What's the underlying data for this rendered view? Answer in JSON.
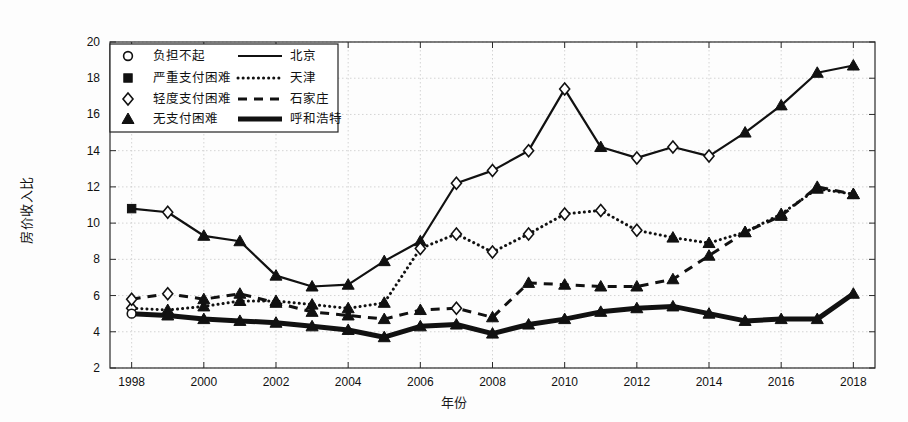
{
  "figure": {
    "background": "#fdfdfd",
    "frame_color": "#2a2a2a",
    "grid_color": "#c9c9c9"
  },
  "axes": {
    "ylabel": "房价收入比",
    "xlabel": "年份",
    "y_ticks": [
      "2",
      "4",
      "6",
      "8",
      "10",
      "12",
      "14",
      "16",
      "18",
      "20"
    ],
    "x_ticks": [
      "1998",
      "2000",
      "2002",
      "2004",
      "2006",
      "2008",
      "2010",
      "2012",
      "2014",
      "2016",
      "2018"
    ]
  },
  "legend": {
    "marker_entries": [
      {
        "marker": "circle-open-marker",
        "label": "负担不起"
      },
      {
        "marker": "square-filled-marker",
        "label": "严重支付困难"
      },
      {
        "marker": "diamond-open-marker",
        "label": "轻度支付困难"
      },
      {
        "marker": "triangle-filled-marker",
        "label": "无支付困难"
      }
    ],
    "line_entries": [
      {
        "style": "solid-thin-line",
        "label": "北京"
      },
      {
        "style": "dotted-line",
        "label": "天津"
      },
      {
        "style": "dashed-line",
        "label": "石家庄"
      },
      {
        "style": "solid-thick-line",
        "label": "呼和浩特"
      }
    ]
  },
  "chart_data": {
    "type": "line",
    "title": "",
    "xlabel": "年份",
    "ylabel": "房价收入比",
    "xlim": [
      1997.4,
      2018.6
    ],
    "ylim": [
      2,
      20
    ],
    "grid": true,
    "legend_position": "upper-left",
    "x": [
      1998,
      1999,
      2000,
      2001,
      2002,
      2003,
      2004,
      2005,
      2006,
      2007,
      2008,
      2009,
      2010,
      2011,
      2012,
      2013,
      2014,
      2015,
      2016,
      2017,
      2018
    ],
    "series": [
      {
        "name": "北京",
        "style": "solid-thin-line",
        "values": [
          10.8,
          10.6,
          9.3,
          9.0,
          7.1,
          6.5,
          6.6,
          7.9,
          9.0,
          12.2,
          12.9,
          14.0,
          17.4,
          14.2,
          13.6,
          14.2,
          13.7,
          15.0,
          16.5,
          18.3,
          18.7
        ],
        "markers": [
          "square-filled-marker",
          "diamond-open-marker",
          "triangle-filled-marker",
          "triangle-filled-marker",
          "triangle-filled-marker",
          "triangle-filled-marker",
          "triangle-filled-marker",
          "triangle-filled-marker",
          "triangle-filled-marker",
          "diamond-open-marker",
          "diamond-open-marker",
          "diamond-open-marker",
          "diamond-open-marker",
          "triangle-filled-marker",
          "diamond-open-marker",
          "diamond-open-marker",
          "diamond-open-marker",
          "triangle-filled-marker",
          "triangle-filled-marker",
          "triangle-filled-marker",
          "triangle-filled-marker"
        ]
      },
      {
        "name": "天津",
        "style": "dotted-line",
        "values": [
          5.3,
          5.2,
          5.4,
          5.7,
          5.7,
          5.5,
          5.3,
          5.6,
          8.6,
          9.4,
          8.4,
          9.4,
          10.5,
          10.7,
          9.6,
          9.2,
          8.9,
          9.5,
          10.5,
          11.9,
          11.6
        ],
        "markers": [
          "diamond-open-marker",
          "triangle-filled-marker",
          "triangle-filled-marker",
          "triangle-filled-marker",
          "triangle-filled-marker",
          "triangle-filled-marker",
          "triangle-filled-marker",
          "triangle-filled-marker",
          "diamond-open-marker",
          "diamond-open-marker",
          "diamond-open-marker",
          "diamond-open-marker",
          "diamond-open-marker",
          "diamond-open-marker",
          "diamond-open-marker",
          "triangle-filled-marker",
          "triangle-filled-marker",
          "triangle-filled-marker",
          "triangle-filled-marker",
          "triangle-filled-marker",
          "triangle-filled-marker"
        ]
      },
      {
        "name": "石家庄",
        "style": "dashed-line",
        "values": [
          5.8,
          6.1,
          5.8,
          6.1,
          5.6,
          5.1,
          4.9,
          4.7,
          5.2,
          5.3,
          4.8,
          6.7,
          6.6,
          6.5,
          6.5,
          6.9,
          8.2,
          9.5,
          10.4,
          12.0,
          11.6
        ],
        "markers": [
          "diamond-open-marker",
          "diamond-open-marker",
          "triangle-filled-marker",
          "triangle-filled-marker",
          "triangle-filled-marker",
          "triangle-filled-marker",
          "triangle-filled-marker",
          "triangle-filled-marker",
          "triangle-filled-marker",
          "diamond-open-marker",
          "triangle-filled-marker",
          "triangle-filled-marker",
          "triangle-filled-marker",
          "triangle-filled-marker",
          "triangle-filled-marker",
          "triangle-filled-marker",
          "triangle-filled-marker",
          "triangle-filled-marker",
          "triangle-filled-marker",
          "triangle-filled-marker",
          "triangle-filled-marker"
        ]
      },
      {
        "name": "呼和浩特",
        "style": "solid-thick-line",
        "values": [
          5.0,
          4.9,
          4.7,
          4.6,
          4.5,
          4.3,
          4.1,
          3.7,
          4.3,
          4.4,
          3.9,
          4.4,
          4.7,
          5.1,
          5.3,
          5.4,
          5.0,
          4.6,
          4.7,
          4.7,
          6.1
        ],
        "markers": [
          "circle-open-marker",
          "triangle-filled-marker",
          "triangle-filled-marker",
          "triangle-filled-marker",
          "triangle-filled-marker",
          "triangle-filled-marker",
          "triangle-filled-marker",
          "triangle-filled-marker",
          "triangle-filled-marker",
          "triangle-filled-marker",
          "triangle-filled-marker",
          "triangle-filled-marker",
          "triangle-filled-marker",
          "triangle-filled-marker",
          "triangle-filled-marker",
          "triangle-filled-marker",
          "triangle-filled-marker",
          "triangle-filled-marker",
          "triangle-filled-marker",
          "triangle-filled-marker",
          "triangle-filled-marker"
        ]
      }
    ]
  }
}
